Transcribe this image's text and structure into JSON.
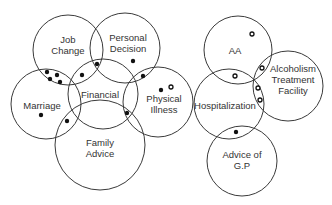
{
  "diagrams": [
    {
      "name": "left-venn",
      "circles": [
        {
          "id": "job-change",
          "label_lines": [
            "Job",
            "Change"
          ],
          "cx": 68,
          "cy": 50,
          "r": 35,
          "lx": 68,
          "ly": 45
        },
        {
          "id": "personal-decision",
          "label_lines": [
            "Personal",
            "Decision"
          ],
          "cx": 125,
          "cy": 48,
          "r": 35,
          "lx": 128,
          "ly": 43
        },
        {
          "id": "marriage",
          "label_lines": [
            "Marriage"
          ],
          "cx": 46,
          "cy": 104,
          "r": 35,
          "lx": 42,
          "ly": 106
        },
        {
          "id": "financial",
          "label_lines": [
            "Financial"
          ],
          "cx": 103,
          "cy": 94,
          "r": 35,
          "lx": 100,
          "ly": 95
        },
        {
          "id": "physical-illness",
          "label_lines": [
            "Physical",
            "Illness"
          ],
          "cx": 158,
          "cy": 102,
          "r": 35,
          "lx": 164,
          "ly": 104
        },
        {
          "id": "family-advice",
          "label_lines": [
            "Family",
            "Advice"
          ],
          "cx": 100,
          "cy": 145,
          "r": 45,
          "lx": 100,
          "ly": 148
        }
      ],
      "dots": [
        {
          "type": "filled",
          "x": 47,
          "y": 72
        },
        {
          "type": "filled",
          "x": 57,
          "y": 75
        },
        {
          "type": "filled",
          "x": 50,
          "y": 79
        },
        {
          "type": "filled",
          "x": 60,
          "y": 82
        },
        {
          "type": "filled",
          "x": 82,
          "y": 75
        },
        {
          "type": "filled",
          "x": 97,
          "y": 64
        },
        {
          "type": "filled",
          "x": 133,
          "y": 61
        },
        {
          "type": "filled",
          "x": 143,
          "y": 76
        },
        {
          "type": "filled",
          "x": 161,
          "y": 90
        },
        {
          "type": "hollow",
          "x": 171,
          "y": 87
        },
        {
          "type": "filled",
          "x": 41,
          "y": 115
        },
        {
          "type": "filled",
          "x": 67,
          "y": 121
        },
        {
          "type": "filled",
          "x": 127,
          "y": 113
        }
      ]
    },
    {
      "name": "right-venn",
      "circles": [
        {
          "id": "aa",
          "label_lines": [
            "AA"
          ],
          "cx": 238,
          "cy": 50,
          "r": 34,
          "lx": 235,
          "ly": 51
        },
        {
          "id": "alcoholism-treatment-facility",
          "label_lines": [
            "Alcoholism",
            "Treatment",
            "Facility"
          ],
          "cx": 288,
          "cy": 86,
          "r": 35,
          "lx": 293,
          "ly": 80
        },
        {
          "id": "hospitalization",
          "label_lines": [
            "Hospitalization"
          ],
          "cx": 229,
          "cy": 104,
          "r": 35,
          "lx": 225,
          "ly": 106
        },
        {
          "id": "advice-of-gp",
          "label_lines": [
            "Advice of",
            "G.P"
          ],
          "cx": 242,
          "cy": 161,
          "r": 35,
          "lx": 242,
          "ly": 160
        }
      ],
      "dots": [
        {
          "type": "hollow",
          "x": 252,
          "y": 34
        },
        {
          "type": "hollow",
          "x": 262,
          "y": 68
        },
        {
          "type": "hollow",
          "x": 235,
          "y": 76
        },
        {
          "type": "hollow",
          "x": 258,
          "y": 88
        },
        {
          "type": "hollow",
          "x": 260,
          "y": 100
        },
        {
          "type": "filled",
          "x": 236,
          "y": 132
        }
      ]
    }
  ]
}
